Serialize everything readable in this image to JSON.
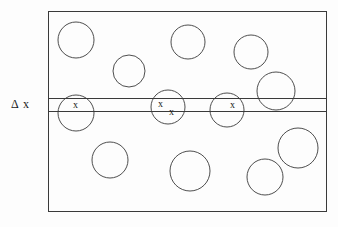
{
  "figure": {
    "title": "",
    "background_color": "#fdfdfd",
    "stroke_color": "#3a3a3a",
    "text_color": "#1a1a1a",
    "labels": {
      "delta_x": "Δ x",
      "cross_mark": "x"
    },
    "box": {
      "x": 48,
      "y": 11,
      "width": 278,
      "height": 200,
      "stroke_width": 1
    },
    "strip": {
      "name": "delta-x-strip",
      "top_line_y": 98,
      "bottom_line_y": 111,
      "x_start": 48,
      "x_end": 326,
      "thickness": 13
    },
    "circles": [
      {
        "name": "circle-top-left",
        "cx": 76,
        "cy": 40,
        "r": 18
      },
      {
        "name": "circle-upper-mid-left",
        "cx": 129,
        "cy": 71,
        "r": 16
      },
      {
        "name": "circle-top-middle",
        "cx": 188,
        "cy": 42,
        "r": 17
      },
      {
        "name": "circle-top-right",
        "cx": 251,
        "cy": 52,
        "r": 17
      },
      {
        "name": "circle-right-upper",
        "cx": 276,
        "cy": 91,
        "r": 19
      },
      {
        "name": "circle-strip-left",
        "cx": 76,
        "cy": 113,
        "r": 18
      },
      {
        "name": "circle-strip-middle",
        "cx": 168,
        "cy": 107,
        "r": 17
      },
      {
        "name": "circle-strip-right",
        "cx": 227,
        "cy": 110,
        "r": 17
      },
      {
        "name": "circle-bottom-left",
        "cx": 110,
        "cy": 160,
        "r": 18
      },
      {
        "name": "circle-bottom-middle",
        "cx": 190,
        "cy": 171,
        "r": 20
      },
      {
        "name": "circle-bottom-right",
        "cx": 265,
        "cy": 177,
        "r": 18
      },
      {
        "name": "circle-right-lower",
        "cx": 298,
        "cy": 148,
        "r": 20
      }
    ],
    "cross_marks": [
      {
        "name": "x-mark-strip-left",
        "x": 73,
        "y": 100
      },
      {
        "name": "x-mark-strip-middle-upper",
        "x": 158,
        "y": 99
      },
      {
        "name": "x-mark-strip-middle-lower",
        "x": 169,
        "y": 107
      },
      {
        "name": "x-mark-strip-right",
        "x": 230,
        "y": 100
      }
    ],
    "delta_label_pos": {
      "x": 11,
      "y": 98
    }
  }
}
